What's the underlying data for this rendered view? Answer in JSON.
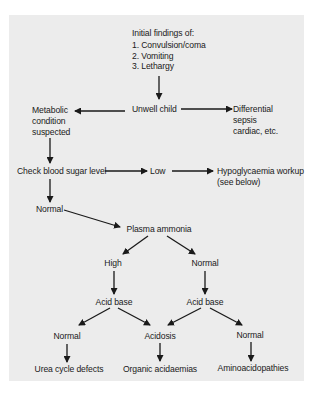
{
  "diagram": {
    "type": "flowchart",
    "nodes": {
      "initial_header": "Initial findings of:",
      "initial_items": [
        "1.  Convulsion/coma",
        "2.  Vomiting",
        "3.  Lethargy"
      ],
      "unwell_child": "Unwell child",
      "metabolic": [
        "Metabolic",
        "condition",
        "suspected"
      ],
      "differential": [
        "Differential",
        "sepsis",
        "cardiac, etc."
      ],
      "check_sugar": "Check blood sugar level",
      "low": "Low",
      "hypo": [
        "Hypoglycaemia workup",
        "(see below)"
      ],
      "normal_sugar": "Normal",
      "plasma_ammonia": "Plasma ammonia",
      "high": "High",
      "normal_ammonia": "Normal",
      "acid_base_left": "Acid base",
      "acid_base_right": "Acid base",
      "normal_left": "Normal",
      "acidosis": "Acidosis",
      "normal_right": "Normal",
      "urea": "Urea cycle defects",
      "organic": "Organic acidaemias",
      "amino": "Aminoacidopathies"
    },
    "edges": [
      [
        "initial_findings",
        "unwell_child"
      ],
      [
        "unwell_child",
        "metabolic"
      ],
      [
        "unwell_child",
        "differential"
      ],
      [
        "metabolic",
        "check_sugar"
      ],
      [
        "check_sugar",
        "low"
      ],
      [
        "low",
        "hypo"
      ],
      [
        "check_sugar",
        "normal_sugar"
      ],
      [
        "normal_sugar",
        "plasma_ammonia"
      ],
      [
        "plasma_ammonia",
        "high"
      ],
      [
        "plasma_ammonia",
        "normal_ammonia"
      ],
      [
        "high",
        "acid_base_left"
      ],
      [
        "normal_ammonia",
        "acid_base_right"
      ],
      [
        "acid_base_left",
        "normal_left"
      ],
      [
        "acid_base_left",
        "acidosis"
      ],
      [
        "acid_base_right",
        "acidosis"
      ],
      [
        "acid_base_right",
        "normal_right"
      ],
      [
        "normal_left",
        "urea"
      ],
      [
        "acidosis",
        "organic"
      ],
      [
        "normal_right",
        "amino"
      ]
    ],
    "colors": {
      "panel": "#ececec",
      "ink": "#1a1a1a"
    }
  }
}
